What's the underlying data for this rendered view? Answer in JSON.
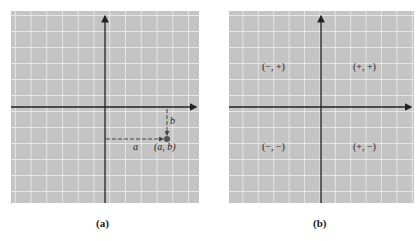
{
  "panel_a": {
    "caption": "(a)",
    "point_label": "(a, b)",
    "horizontal_label": "a",
    "vertical_label": "b"
  },
  "panel_b": {
    "caption": "(b)",
    "quadrants": {
      "q2": "(−, +)",
      "q1": "(+, +)",
      "q3": "(−, −)",
      "q4": "(+, −)"
    }
  },
  "figure_label": "Figure 7.7",
  "colors": {
    "grid_bg": "#c4c4c4",
    "grid_line": "#f2f2f2",
    "axis": "#222222"
  }
}
